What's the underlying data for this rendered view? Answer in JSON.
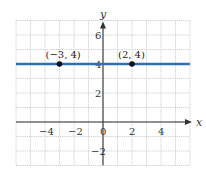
{
  "chart_data": {
    "type": "line",
    "title": "",
    "xlabel": "x",
    "ylabel": "y",
    "xlim": [
      -6,
      6
    ],
    "ylim": [
      -3,
      7
    ],
    "grid": true,
    "x_ticks": [
      -4,
      -2,
      0,
      2,
      4
    ],
    "y_ticks": [
      -2,
      2,
      4,
      6
    ],
    "x_tick_labels": [
      "−4",
      "−2",
      "0",
      "2",
      "4"
    ],
    "y_tick_labels": [
      "−2",
      "2",
      "4",
      "6"
    ],
    "series": [
      {
        "name": "y = 4",
        "type": "line",
        "color": "#2f6fb5",
        "x": [
          -6,
          6
        ],
        "y": [
          4,
          4
        ]
      }
    ],
    "points": [
      {
        "x": -3,
        "y": 4,
        "label": "(−3, 4)"
      },
      {
        "x": 2,
        "y": 4,
        "label": "(2, 4)"
      }
    ],
    "colors": {
      "line": "#2f6fb5",
      "grid": "#b8b8b8",
      "axis": "#333333",
      "point": "#111111"
    }
  }
}
